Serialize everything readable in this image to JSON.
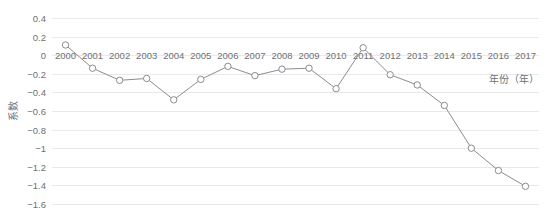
{
  "chart_data": {
    "type": "line",
    "title": "",
    "xlabel": "年份（年）",
    "ylabel": "系数",
    "categories": [
      "2000",
      "2001",
      "2002",
      "2003",
      "2004",
      "2005",
      "2006",
      "2007",
      "2008",
      "2009",
      "2010",
      "2011",
      "2012",
      "2013",
      "2014",
      "2015",
      "2016",
      "2017"
    ],
    "values": [
      0.11,
      -0.14,
      -0.27,
      -0.25,
      -0.48,
      -0.26,
      -0.12,
      -0.22,
      -0.15,
      -0.14,
      -0.36,
      0.08,
      -0.21,
      -0.32,
      -0.54,
      -1.0,
      -1.24,
      -1.41
    ],
    "series": [
      {
        "name": "系数",
        "values": [
          0.11,
          -0.14,
          -0.27,
          -0.25,
          -0.48,
          -0.26,
          -0.12,
          -0.22,
          -0.15,
          -0.14,
          -0.36,
          0.08,
          -0.21,
          -0.32,
          -0.54,
          -1.0,
          -1.24,
          -1.41
        ]
      }
    ],
    "ylim": [
      -1.6,
      0.4
    ],
    "yticks": [
      0.4,
      0.2,
      0,
      -0.2,
      -0.4,
      -0.6,
      -0.8,
      -1,
      -1.2,
      -1.4,
      -1.6
    ],
    "ytick_labels": [
      "0.4",
      "0.2",
      "0",
      "−0.2",
      "−0.4",
      "−0.6",
      "−0.8",
      "−1",
      "−1.2",
      "−1.4",
      "−1.6"
    ],
    "grid": true,
    "legend": false,
    "legend_position": "none",
    "marker": "open-circle",
    "line_color": "#8c8c92",
    "marker_fill": "#ffffff",
    "grid_color": "#e9e9ec",
    "text_color": "#6f6f74",
    "background": "#ffffff"
  }
}
